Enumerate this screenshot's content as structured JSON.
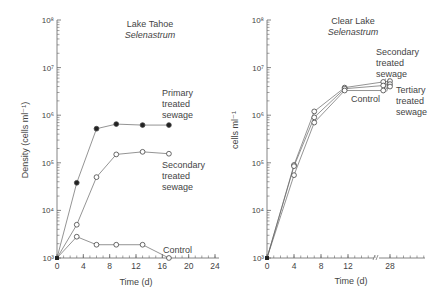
{
  "chart_data": [
    {
      "type": "line",
      "title": "Lake Tahoe",
      "subtitle": "Selenastrum",
      "xlabel": "Time (d)",
      "ylabel": "Density (cells ml⁻¹)",
      "yscale": "log",
      "xlim": [
        0,
        24
      ],
      "ylim": [
        1000,
        100000000
      ],
      "xticks": [
        0,
        4,
        8,
        12,
        16,
        20,
        24
      ],
      "yticks": [
        1000,
        10000,
        100000,
        1000000,
        10000000,
        100000000
      ],
      "ytick_labels": [
        "10³",
        "10⁴",
        "10⁵",
        "10⁶",
        "10⁷",
        "10⁸"
      ],
      "grid": false,
      "series": [
        {
          "name": "Primary treated sewage",
          "label_lines": [
            "Primary",
            "treated",
            "sewage"
          ],
          "marker": "filled-circle",
          "x": [
            0,
            3,
            6,
            9,
            13,
            17
          ],
          "y": [
            1000,
            38000,
            520000,
            650000,
            620000,
            620000
          ]
        },
        {
          "name": "Secondary treated sewage",
          "label_lines": [
            "Secondary",
            "treated",
            "sewage"
          ],
          "marker": "open-circle",
          "x": [
            0,
            3,
            6,
            9,
            13,
            17
          ],
          "y": [
            1000,
            5000,
            50000,
            150000,
            170000,
            155000
          ]
        },
        {
          "name": "Control",
          "label_lines": [
            "Control"
          ],
          "marker": "open-circle",
          "x": [
            0,
            3,
            6,
            9,
            13,
            17
          ],
          "y": [
            1000,
            2800,
            1900,
            1900,
            1900,
            1000
          ]
        }
      ]
    },
    {
      "type": "line",
      "title": "Clear Lake",
      "subtitle": "Selenastrum",
      "xlabel": "Time (d)",
      "ylabel": "cells ml⁻¹",
      "yscale": "log",
      "xlim": [
        0,
        32
      ],
      "ylim": [
        1000,
        100000000
      ],
      "xticks": [
        0,
        4,
        8,
        12,
        28
      ],
      "axis_break_after": 16,
      "yticks": [
        1000,
        10000,
        100000,
        1000000,
        10000000,
        100000000
      ],
      "ytick_labels": [
        "10³",
        "10⁴",
        "10⁵",
        "10⁶",
        "10⁷",
        "10⁸"
      ],
      "grid": false,
      "series": [
        {
          "name": "Secondary treated sewage",
          "label_lines": [
            "Secondary",
            "treated",
            "sewage"
          ],
          "marker": "open-circle",
          "x": [
            0,
            4,
            7,
            11.5,
            25,
            28
          ],
          "y": [
            1000,
            90000,
            1200000,
            3800000,
            5000000,
            5200000
          ]
        },
        {
          "name": "Tertiary treated sewage",
          "label_lines": [
            "Tertiary",
            "treated",
            "sewage"
          ],
          "marker": "open-circle",
          "x": [
            0,
            4,
            7,
            11.5,
            25,
            28
          ],
          "y": [
            1000,
            85000,
            900000,
            3600000,
            4200000,
            4500000
          ]
        },
        {
          "name": "Control",
          "label_lines": [
            "Control"
          ],
          "marker": "open-circle",
          "x": [
            0,
            4,
            7,
            11.5,
            25,
            28
          ],
          "y": [
            1000,
            55000,
            700000,
            3300000,
            3300000,
            4000000
          ]
        }
      ]
    }
  ]
}
